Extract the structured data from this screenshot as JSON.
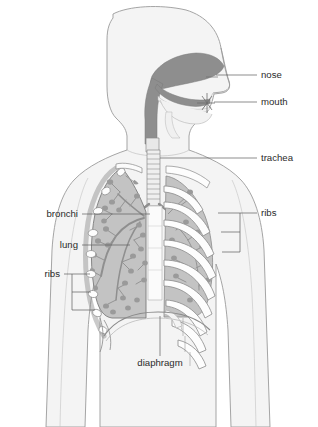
{
  "image": {
    "title": "Human respiratory system diagram",
    "type": "anatomical-illustration",
    "width": 318,
    "height": 427,
    "background_color": "#ffffff"
  },
  "colors": {
    "background": "#ffffff",
    "body_fill": "#f4f4f4",
    "body_outline": "#9b9b9b",
    "lung_fill": "#c3c3c3",
    "lung_outline": "#7c7c7c",
    "airway_dark": "#8e8e8e",
    "bone_white": "#fdfdfd",
    "bone_outline": "#8a8a8a",
    "bronchi_stroke": "#8f8f8f",
    "alveoli_fill": "#9a9a9a",
    "label_text": "#2b2b2b",
    "leader_line": "#5d5d5d"
  },
  "labels": {
    "nose": "nose",
    "mouth": "mouth",
    "trachea": "trachea",
    "ribs_right": "ribs",
    "bronchi": "bronchi",
    "lung": "lung",
    "ribs_left": "ribs",
    "diaphragm": "diaphragm"
  },
  "label_positions": {
    "nose": {
      "x": 261,
      "y": 78,
      "align": "start"
    },
    "mouth": {
      "x": 261,
      "y": 105,
      "align": "start"
    },
    "trachea": {
      "x": 261,
      "y": 161,
      "align": "start"
    },
    "ribs_right": {
      "x": 261,
      "y": 216,
      "align": "start"
    },
    "bronchi": {
      "x": 78,
      "y": 217,
      "align": "end"
    },
    "lung": {
      "x": 78,
      "y": 248,
      "align": "end"
    },
    "ribs_left": {
      "x": 60,
      "y": 277,
      "align": "end"
    },
    "diaphragm": {
      "x": 160,
      "y": 363,
      "align": "middle"
    }
  },
  "parts": [
    {
      "name": "nose",
      "description": "nasal cavity and external nose"
    },
    {
      "name": "mouth",
      "description": "oral cavity with tongue"
    },
    {
      "name": "trachea",
      "description": "windpipe with cartilage rings"
    },
    {
      "name": "ribs",
      "description": "rib cage, left cross-sections and right arcs"
    },
    {
      "name": "bronchi",
      "description": "branching bronchial tree in left lung"
    },
    {
      "name": "lung",
      "description": "left lung shaded, right lung behind ribs"
    },
    {
      "name": "diaphragm",
      "description": "dome-shaped muscle below lungs"
    }
  ]
}
